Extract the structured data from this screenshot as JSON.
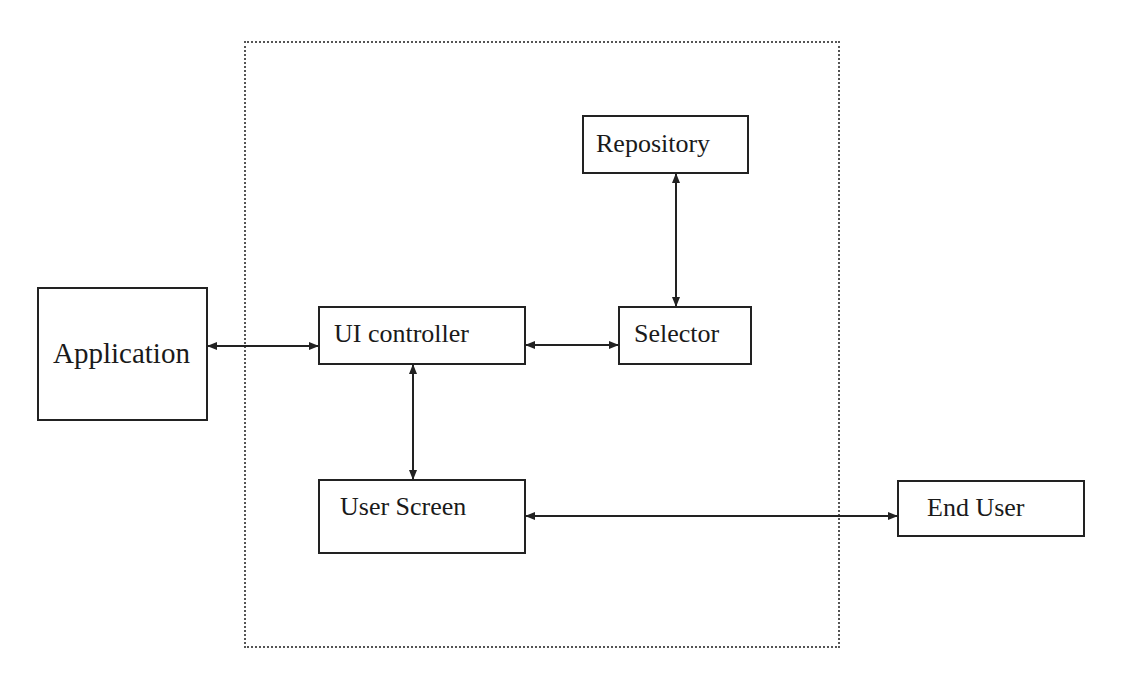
{
  "diagram": {
    "type": "block-diagram",
    "boundary": {
      "style": "dotted",
      "label": ""
    },
    "nodes": [
      {
        "id": "application",
        "label": "Application"
      },
      {
        "id": "ui_controller",
        "label": "UI controller"
      },
      {
        "id": "selector",
        "label": "Selector"
      },
      {
        "id": "repository",
        "label": "Repository"
      },
      {
        "id": "user_screen",
        "label": "User Screen"
      },
      {
        "id": "end_user",
        "label": "End User"
      }
    ],
    "edges": [
      {
        "from": "application",
        "to": "ui_controller",
        "direction": "bidirectional"
      },
      {
        "from": "ui_controller",
        "to": "selector",
        "direction": "bidirectional"
      },
      {
        "from": "selector",
        "to": "repository",
        "direction": "bidirectional"
      },
      {
        "from": "ui_controller",
        "to": "user_screen",
        "direction": "bidirectional"
      },
      {
        "from": "user_screen",
        "to": "end_user",
        "direction": "bidirectional"
      }
    ]
  }
}
